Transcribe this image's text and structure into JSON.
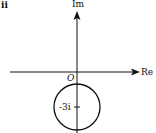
{
  "figure": {
    "part_label": "ii",
    "axes": {
      "real_label": "Re",
      "imag_label": "Im",
      "origin_label": "O"
    },
    "circle": {
      "center_label": "-3i",
      "center": [
        0,
        -3
      ],
      "radius_px": 23
    },
    "colors": {
      "stroke": "#111111",
      "background": "#ffffff"
    }
  }
}
